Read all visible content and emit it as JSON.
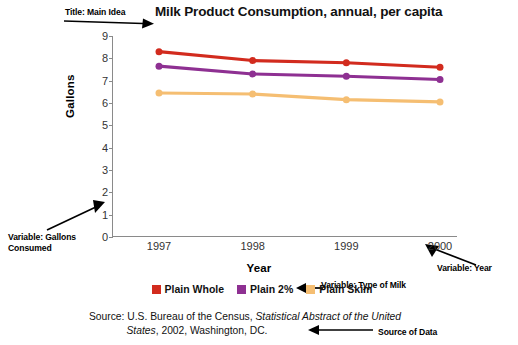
{
  "chart_data": {
    "type": "line",
    "title": "Milk Product Consumption, annual, per capita",
    "xlabel": "Year",
    "ylabel": "Gallons",
    "categories": [
      "1997",
      "1998",
      "1999",
      "2000"
    ],
    "ylim": [
      0,
      9
    ],
    "yticks": [
      0,
      1,
      2,
      3,
      4,
      5,
      6,
      7,
      8,
      9
    ],
    "grid": false,
    "legend_position": "bottom",
    "series": [
      {
        "name": "Plain Whole",
        "color": "#D22B1E",
        "values": [
          8.3,
          7.9,
          7.8,
          7.6
        ]
      },
      {
        "name": "Plain 2%",
        "color": "#8E3092",
        "values": [
          7.65,
          7.3,
          7.2,
          7.05
        ]
      },
      {
        "name": "Plain Skim",
        "color": "#F5BE72",
        "values": [
          6.45,
          6.4,
          6.15,
          6.05
        ]
      }
    ],
    "source": {
      "line1_prefix": "Source: U.S. Bureau of the Census, ",
      "line1_italic": "Statistical Abstract of the United",
      "line2_italic": "States",
      "line2_suffix": ", 2002, Washington, DC."
    }
  },
  "annotations": {
    "title": "Title: Main Idea",
    "gallons": "Variable: Gallons Consumed",
    "year": "Variable: Year",
    "type_of_milk": "Variable: Type of Milk",
    "source": "Source of Data"
  }
}
